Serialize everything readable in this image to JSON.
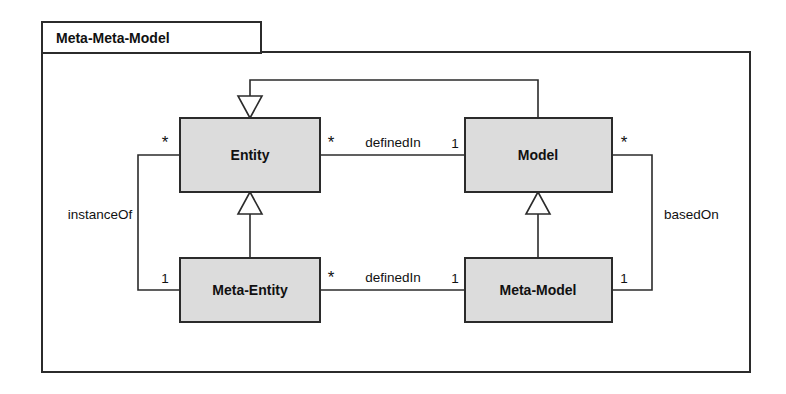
{
  "diagram": {
    "kind": "uml-class-diagram",
    "package": {
      "tab_label": "Meta-Meta-Model"
    },
    "colors": {
      "class_fill": "#dcdcdc",
      "stroke": "#2b2b2b",
      "background": "#ffffff",
      "arrow_fill": "#ffffff",
      "text": "#111111"
    },
    "classes": [
      {
        "id": "entity",
        "name": "Entity",
        "x": 180,
        "y": 118,
        "w": 140,
        "h": 74
      },
      {
        "id": "model",
        "name": "Model",
        "x": 465,
        "y": 118,
        "w": 147,
        "h": 74
      },
      {
        "id": "meta-entity",
        "name": "Meta-Entity",
        "x": 180,
        "y": 258,
        "w": 140,
        "h": 64
      },
      {
        "id": "meta-model",
        "name": "Meta-Model",
        "x": 465,
        "y": 258,
        "w": 147,
        "h": 64
      }
    ],
    "associations": [
      {
        "id": "entity-definedin-model",
        "label": "definedIn",
        "source": "Entity",
        "target": "Model",
        "source_multiplicity": "*",
        "target_multiplicity": "1"
      },
      {
        "id": "metaentity-definedin-metamodel",
        "label": "definedIn",
        "source": "Meta-Entity",
        "target": "Meta-Model",
        "source_multiplicity": "*",
        "target_multiplicity": "1"
      },
      {
        "id": "entity-instanceof-metaentity",
        "label": "instanceOf",
        "source": "Entity",
        "target": "Meta-Entity",
        "source_multiplicity": "*",
        "target_multiplicity": "1"
      },
      {
        "id": "model-basedon-metamodel",
        "label": "basedOn",
        "source": "Model",
        "target": "Meta-Model",
        "source_multiplicity": "*",
        "target_multiplicity": "1"
      }
    ],
    "generalizations": [
      {
        "id": "model-to-entity",
        "from": "Model",
        "to": "Entity",
        "routing": "top-loop"
      },
      {
        "id": "metaentity-to-entity",
        "from": "Meta-Entity",
        "to": "Entity",
        "routing": "vertical"
      },
      {
        "id": "metamodel-to-model",
        "from": "Meta-Model",
        "to": "Model",
        "routing": "vertical"
      }
    ]
  }
}
